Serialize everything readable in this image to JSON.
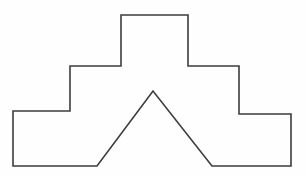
{
  "figure": {
    "shape_name": "ziggurat-outline-with-v-notch",
    "type": "line-drawing",
    "background_color": "#fefefe",
    "stroke_color": "#3c3c3c",
    "stroke_width": 1.6,
    "fill": "none",
    "closed": true,
    "canvas": {
      "width": 306,
      "height": 177
    },
    "vertices": [
      [
        13,
        111
      ],
      [
        70,
        111
      ],
      [
        70,
        66
      ],
      [
        121,
        66
      ],
      [
        121,
        15
      ],
      [
        188,
        15
      ],
      [
        188,
        66
      ],
      [
        239,
        66
      ],
      [
        239,
        114
      ],
      [
        291,
        114
      ],
      [
        291,
        166
      ],
      [
        212,
        166
      ],
      [
        153,
        91
      ],
      [
        97,
        166
      ],
      [
        13,
        166
      ]
    ],
    "path_d": "M 13 111 L 70 111 L 70 66 L 121 66 L 121 15 L 188 15 L 188 66 L 239 66 L 239 114 L 291 114 L 291 166 L 212 166 L 153 91 L 97 166 L 13 166 Z",
    "vertex_count": 15,
    "apex": [
      153,
      91
    ],
    "symmetry_axis_x": 152
  }
}
